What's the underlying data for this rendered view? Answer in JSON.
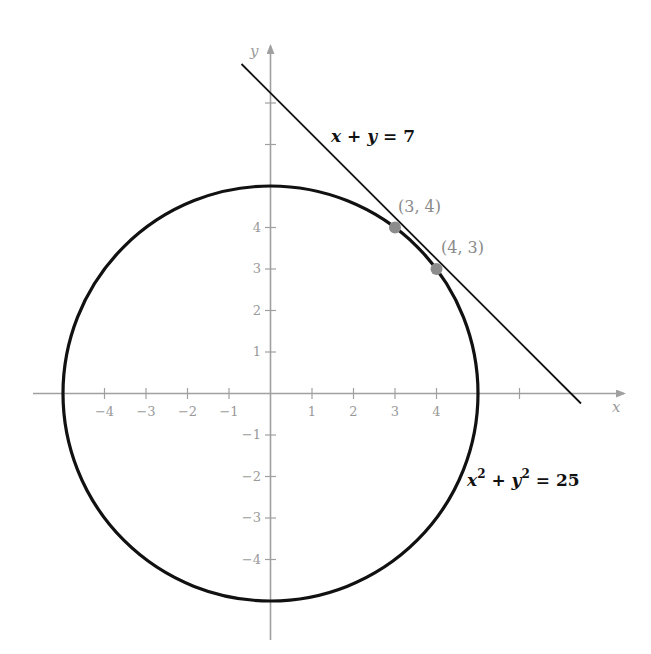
{
  "figure": {
    "axes": {
      "x_label": "x",
      "y_label": "y",
      "x_ticks": [
        {
          "value": -4,
          "label": "−4"
        },
        {
          "value": -3,
          "label": "−3"
        },
        {
          "value": -2,
          "label": "−2"
        },
        {
          "value": -1,
          "label": "−1"
        },
        {
          "value": 1,
          "label": "1"
        },
        {
          "value": 2,
          "label": "2"
        },
        {
          "value": 3,
          "label": "3"
        },
        {
          "value": 4,
          "label": "4"
        }
      ],
      "y_ticks": [
        {
          "value": 4,
          "label": "4"
        },
        {
          "value": 3,
          "label": "3"
        },
        {
          "value": 2,
          "label": "2"
        },
        {
          "value": 1,
          "label": "1"
        },
        {
          "value": -1,
          "label": "−1"
        },
        {
          "value": -2,
          "label": "−2"
        },
        {
          "value": -3,
          "label": "−3"
        },
        {
          "value": -4,
          "label": "−4"
        }
      ],
      "color": "#a0a0a0"
    },
    "curves": {
      "circle": {
        "equation_label": "x² + y² = 25",
        "radius": 5,
        "center": [
          0,
          0
        ],
        "color": "#111111"
      },
      "line": {
        "equation_label": "x + y = 7",
        "slope": -1,
        "intercept": 7,
        "color": "#111111"
      }
    },
    "points": [
      {
        "label": "(3, 4)",
        "x": 3,
        "y": 4,
        "color": "#8c8c8c"
      },
      {
        "label": "(4, 3)",
        "x": 4,
        "y": 3,
        "color": "#8c8c8c"
      }
    ],
    "labels": {
      "line_eq_lhs_x": "x",
      "line_eq_plus": " + ",
      "line_eq_y": "y",
      "line_eq_rhs": " = 7",
      "circle_eq_x": "x",
      "circle_eq_sup1": "2",
      "circle_eq_plus": " + ",
      "circle_eq_y": "y",
      "circle_eq_sup2": "2",
      "circle_eq_rhs": " = 25",
      "point_a": "(3, 4)",
      "point_b": "(4, 3)",
      "x_axis": "x",
      "y_axis": "y",
      "xt_m4": "−4",
      "xt_m3": "−3",
      "xt_m2": "−2",
      "xt_m1": "−1",
      "xt_1": "1",
      "xt_2": "2",
      "xt_3": "3",
      "xt_4": "4",
      "yt_4": "4",
      "yt_3": "3",
      "yt_2": "2",
      "yt_1": "1",
      "yt_m1": "−1",
      "yt_m2": "−2",
      "yt_m3": "−3",
      "yt_m4": "−4"
    }
  }
}
